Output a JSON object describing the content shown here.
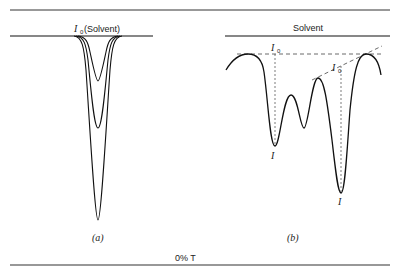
{
  "diagram": {
    "panel_a": {
      "baseline_label_symbol": "I",
      "baseline_label_subscript": "0",
      "baseline_label_text": "(Solvent)",
      "caption": "(a)"
    },
    "panel_b": {
      "baseline_label": "Solvent",
      "i0_symbol": "I",
      "i0_subscript": "0",
      "i_label": "I",
      "caption": "(b)"
    },
    "bottom_label": "0% T"
  }
}
